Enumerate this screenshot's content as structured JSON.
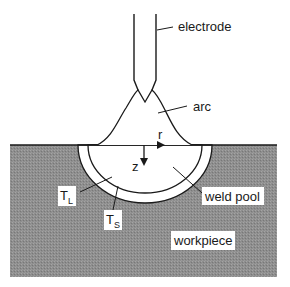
{
  "diagram": {
    "labels": {
      "electrode": "electrode",
      "arc": "arc",
      "r_axis": "r",
      "z_axis": "z",
      "weld_pool": "weld pool",
      "workpiece": "workpiece",
      "liquidus_main": "T",
      "liquidus_sub": "L",
      "solidus_main": "T",
      "solidus_sub": "S"
    },
    "colors": {
      "workpiece_fill": "#8c8c8c",
      "line": "#1a1a1a",
      "background": "#ffffff"
    }
  }
}
